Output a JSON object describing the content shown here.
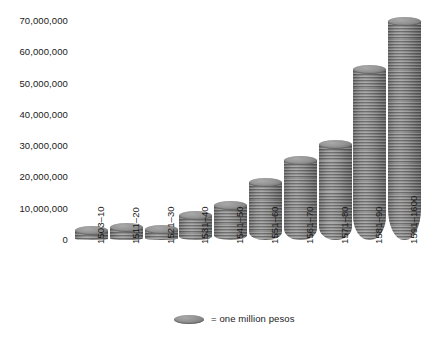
{
  "chart_data": {
    "type": "bar",
    "title": "",
    "subtitle": "",
    "xlabel": "",
    "ylabel": "",
    "ylim": [
      0,
      70000000
    ],
    "grid": false,
    "legend_position": "bottom",
    "categories": [
      "1503–10",
      "1511–20",
      "1521–30",
      "1531–40",
      "1541–50",
      "1551–60",
      "1561–70",
      "1571–80",
      "1581–90",
      "1591–1600"
    ],
    "values": [
      1500000,
      2500000,
      2000000,
      6500000,
      9500000,
      17000000,
      24000000,
      29000000,
      53000000,
      68500000
    ],
    "ytick_labels": [
      "70,000,000",
      "60,000,000",
      "50,000,000",
      "40,000,000",
      "30,000,000",
      "20,000,000",
      "10,000,000",
      "0"
    ],
    "ytick_values": [
      70000000,
      60000000,
      50000000,
      40000000,
      30000000,
      20000000,
      10000000,
      0
    ],
    "legend": [
      {
        "marker": "coin-icon",
        "label": "= one million pesos"
      }
    ],
    "series": [
      {
        "name": "pesos",
        "values": [
          1500000,
          2500000,
          2000000,
          6500000,
          9500000,
          17000000,
          24000000,
          29000000,
          53000000,
          68500000
        ]
      }
    ],
    "colors": {
      "bar": "#818181",
      "bar_top": "#949494",
      "background": "#ffffff",
      "text": "#1a1a1a"
    }
  }
}
